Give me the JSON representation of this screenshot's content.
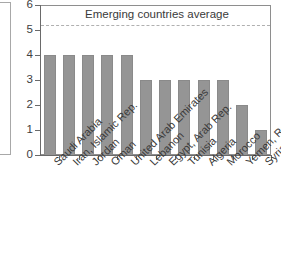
{
  "chart_data": {
    "type": "bar",
    "title": "Emerging countries average",
    "xlabel": "",
    "ylabel": "",
    "ylim": [
      0,
      6
    ],
    "yticks": [
      "0",
      "1",
      "2",
      "3",
      "4",
      "5",
      "6"
    ],
    "grid": false,
    "legend": "none",
    "categories": [
      "Saudi Arabia",
      "Iran, Islamic Rep.",
      "Jordan",
      "Oman",
      "United Arab Emirates",
      "Lebanon",
      "Egypt, Arab Rep.",
      "Tunisia",
      "Algeria",
      "Morocco",
      "Yemen, Rep.",
      "Syrian Arab Republic"
    ],
    "values": [
      4,
      4,
      4,
      4,
      4,
      3,
      3,
      3,
      3,
      3,
      2,
      1
    ],
    "annotations": [
      {
        "name": "emerging-countries-average",
        "label": "Emerging countries average",
        "value": 5.2,
        "style": "dashed-horizontal-line",
        "color": "#b0b0b0"
      }
    ],
    "colors": {
      "bar_fill": "#959595",
      "bar_edge": "#8a8a8a",
      "axis": "#6a6a6a",
      "frame": "#8e8e8e",
      "text": "#3a3a3a",
      "reference_line": "#b0b0b0"
    }
  }
}
